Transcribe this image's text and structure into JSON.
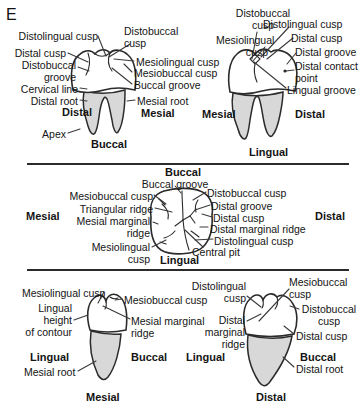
{
  "figure_label": "E",
  "colors": {
    "root_fill": "#d8d8d8",
    "line": "#2b2b2b",
    "text": "#141414"
  },
  "top_section": {
    "buccal_view": {
      "view_name": "Buccal",
      "orientation_left": "Distal",
      "orientation_right": "Mesial",
      "labels": {
        "distolingual_cusp": "Distolingual cusp",
        "distal_cusp": "Distal cusp",
        "distobuccal_groove": "Distobuccal\ngroove",
        "cervical_line": "Cervical line",
        "distal_root": "Distal root",
        "apex": "Apex",
        "distobuccal_cusp": "Distobuccal\ncusp",
        "mesiolingual_cusp": "Mesiolingual cusp",
        "mesiobuccal_cusp": "Mesiobuccal cusp",
        "buccal_groove": "Buccal groove",
        "mesial_root": "Mesial root"
      }
    },
    "lingual_view": {
      "view_name": "Lingual",
      "orientation_left": "Mesial",
      "orientation_right": "Distal",
      "labels": {
        "distobuccal_cusp": "Distobuccal\ncusp",
        "mesiolingual_cusp": "Mesiolingual\ncusp",
        "distolingual_cusp": "Distolingual cusp",
        "distal_cusp": "Distal cusp",
        "distal_groove": "Distal groove",
        "distal_contact_point": "Distal contact\npoint",
        "lingual_groove": "Lingual groove"
      }
    }
  },
  "middle_section": {
    "occlusal_view": {
      "top_label": "Buccal",
      "bottom_label": "Lingual",
      "orientation_left": "Mesial",
      "orientation_right": "Distal",
      "labels": {
        "buccal_groove": "Buccal groove",
        "mesiobuccal_cusp": "Mesiobuccal cusp",
        "triangular_ridge": "Triangular ridge",
        "mesial_marginal_ridge": "Mesial marginal\nridge",
        "mesiolingual_cusp": "Mesiolingual\ncusp",
        "distobuccal_cusp": "Distobuccal cusp",
        "distal_groove": "Distal groove",
        "distal_cusp": "Distal cusp",
        "distal_marginal_ridge": "Distal marginal ridge",
        "distolingual_cusp": "Distolingual cusp",
        "central_pit": "Central pit"
      }
    }
  },
  "bottom_section": {
    "mesial_view": {
      "view_name": "Mesial",
      "orientation_left": "Lingual",
      "orientation_right": "Buccal",
      "labels": {
        "mesiolingual_cusp": "Mesiolingual cusp",
        "lingual_height_of_contour": "Lingual\nheight\nof contour",
        "mesial_root": "Mesial root",
        "mesiobuccal_cusp": "Mesiobuccal cusp",
        "mesial_marginal_ridge": "Mesial marginal\nridge"
      }
    },
    "distal_view": {
      "view_name": "Distal",
      "orientation_left": "Lingual",
      "orientation_right": "Buccal",
      "labels": {
        "distolingual_cusp": "Distolingual\ncusp",
        "distal_marginal_ridge": "Distal\nmarginal\nridge",
        "mesiobuccal_cusp": "Mesiobuccal\ncusp",
        "distobuccal_cusp": "Distobuccal\ncusp",
        "distal_cusp": "Distal cusp",
        "distal_root": "Distal root"
      }
    }
  }
}
